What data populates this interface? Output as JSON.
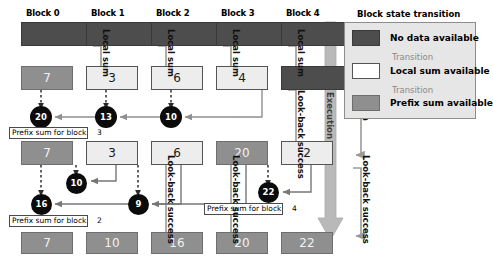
{
  "figure": {
    "caption": "Decoupled look-back prefix sum block state transition diagram"
  },
  "blocks": [
    {
      "title": "Block 0"
    },
    {
      "title": "Block 1"
    },
    {
      "title": "Block 2"
    },
    {
      "title": "Block 3"
    },
    {
      "title": "Block 4"
    }
  ],
  "rows": {
    "row1": [
      {
        "value": "",
        "state": "no-data"
      },
      {
        "value": "",
        "state": "no-data"
      },
      {
        "value": "",
        "state": "no-data"
      },
      {
        "value": "",
        "state": "no-data"
      },
      {
        "value": "",
        "state": "no-data"
      }
    ],
    "row2": [
      {
        "value": "7",
        "state": "prefix-sum"
      },
      {
        "value": "3",
        "state": "local-sum"
      },
      {
        "value": "6",
        "state": "local-sum"
      },
      {
        "value": "4",
        "state": "local-sum"
      },
      {
        "value": "",
        "state": "no-data"
      }
    ],
    "row3": [
      {
        "value": "7",
        "state": "prefix-sum"
      },
      {
        "value": "3",
        "state": "local-sum"
      },
      {
        "value": "6",
        "state": "local-sum"
      },
      {
        "value": "20",
        "state": "prefix-sum"
      },
      {
        "value": "2",
        "state": "local-sum"
      }
    ],
    "row4": [
      {
        "value": "7",
        "state": "prefix-sum"
      },
      {
        "value": "10",
        "state": "prefix-sum"
      },
      {
        "value": "16",
        "state": "prefix-sum"
      },
      {
        "value": "20",
        "state": "prefix-sum"
      },
      {
        "value": "22",
        "state": "prefix-sum"
      }
    ]
  },
  "accumulators": {
    "upper": [
      "20",
      "13",
      "10"
    ],
    "lower_a": [
      "10"
    ],
    "lower_b": [
      "16",
      "9"
    ],
    "lower_c": [
      "22"
    ]
  },
  "captions": {
    "prefix_block3": "Prefix sum for block",
    "prefix_block3_num": "3",
    "prefix_block2": "Prefix sum for block",
    "prefix_block2_num": "2",
    "prefix_block4": "Prefix sum for block",
    "prefix_block4_num": "4"
  },
  "edge_labels": {
    "local_sum": "Local sum",
    "lookback_success": "Look-back success",
    "execution": "Execution"
  },
  "legend": {
    "title": "Block state transition",
    "items": [
      {
        "label": "No data available",
        "state": "no-data"
      },
      {
        "label": "Local sum available",
        "state": "local-sum"
      },
      {
        "label": "Prefix sum available",
        "state": "prefix-sum"
      }
    ],
    "transition_label": "Transition"
  },
  "colors": {
    "no_data": "#4d4d4d",
    "local_sum": "#ededed",
    "prefix_sum": "#8f8f8f",
    "accumulator": "#0b0b0b",
    "legend_bg": "#e6e6e6",
    "execution_arrow": "#b0b0b0",
    "connector": "#9a9a9a"
  }
}
